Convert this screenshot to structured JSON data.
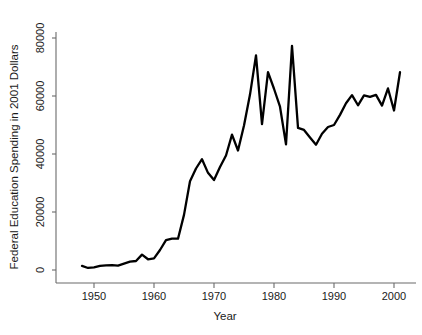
{
  "chart_data": {
    "type": "line",
    "title": "",
    "subtitle": "",
    "xlabel": "Year",
    "ylabel": "Federal Education Spending in 2001 Dollars",
    "xlim": [
      1947,
      2002
    ],
    "ylim": [
      0,
      84000
    ],
    "grid": false,
    "legend": null,
    "legend_position": "none",
    "xticks": [
      1950,
      1960,
      1970,
      1980,
      1990,
      2000
    ],
    "xtick_labels": [
      "1950",
      "1960",
      "1970",
      "1980",
      "1990",
      "2000"
    ],
    "yticks": [
      0,
      20000,
      40000,
      60000,
      80000
    ],
    "ytick_labels": [
      "0",
      "20000",
      "40000",
      "60000",
      "80000"
    ],
    "line_color": "#000000",
    "axis_color": "#6b6b6b",
    "background_color": "#ffffff",
    "series": [
      {
        "name": "Federal Education Spending",
        "x": [
          1948,
          1949,
          1950,
          1951,
          1952,
          1953,
          1954,
          1955,
          1956,
          1957,
          1958,
          1959,
          1960,
          1961,
          1962,
          1963,
          1964,
          1965,
          1966,
          1967,
          1968,
          1969,
          1970,
          1971,
          1972,
          1973,
          1974,
          1975,
          1976,
          1977,
          1978,
          1979,
          1980,
          1981,
          1982,
          1983,
          1984,
          1985,
          1986,
          1987,
          1988,
          1989,
          1990,
          1991,
          1992,
          1993,
          1994,
          1995,
          1996,
          1997,
          1998,
          1999,
          2000,
          2001
        ],
        "values": [
          1400,
          700,
          900,
          1400,
          1600,
          1700,
          1500,
          2200,
          2900,
          3100,
          5300,
          3700,
          4000,
          6900,
          10300,
          10800,
          10800,
          19000,
          30600,
          35000,
          38200,
          33500,
          31000,
          35500,
          39500,
          46700,
          41200,
          49800,
          60500,
          74000,
          50300,
          68200,
          62500,
          56300,
          43300,
          77300,
          49000,
          48300,
          45700,
          43200,
          47000,
          49300,
          50000,
          53500,
          57500,
          60300,
          56800,
          60200,
          59700,
          60400,
          56700,
          62600,
          55000,
          68200
        ]
      }
    ]
  },
  "axes": {
    "x_title": "Year",
    "y_title": "Federal Education Spending in 2001 Dollars"
  }
}
